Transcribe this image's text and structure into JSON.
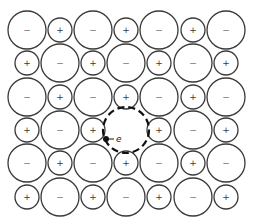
{
  "diagram": {
    "type": "ionic-crystal-lattice",
    "colors": {
      "outline": "#3a3a3a",
      "vacancy": "#111111",
      "electron": "#111111",
      "background": "#ffffff"
    },
    "geometry": {
      "col_x": [
        27,
        60,
        93,
        126,
        159,
        193,
        226
      ],
      "row_y": [
        30,
        63,
        97,
        130,
        163,
        197
      ],
      "anion_radius": 19,
      "cation_radius": 12
    },
    "labels": {
      "anion": "−",
      "cation": "+",
      "electron": "e"
    },
    "grid": [
      [
        "-",
        "+",
        "-",
        "+",
        "-",
        "+",
        "-"
      ],
      [
        "+",
        "-",
        "+",
        "-",
        "+",
        "-",
        "+"
      ],
      [
        "-",
        "+",
        "-",
        "+",
        "-",
        "+",
        "-"
      ],
      [
        "+",
        "-",
        "+",
        "vacancy",
        "+",
        "-",
        "+"
      ],
      [
        "-",
        "+",
        "-",
        "+",
        "-",
        "+",
        "-"
      ],
      [
        "+",
        "-",
        "+",
        "-",
        "+",
        "-",
        "+"
      ]
    ],
    "vacancy": {
      "row": 3,
      "col": 3,
      "cx": 126,
      "cy": 130,
      "r": 23
    },
    "electron": {
      "dot_x": 106,
      "dot_y": 139,
      "dot_r": 3,
      "line_to_x": 114,
      "label_x": 116,
      "label_y": 139,
      "label": "e"
    }
  }
}
